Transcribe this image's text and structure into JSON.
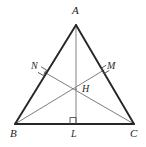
{
  "figure": {
    "kind": "geometry-diagram",
    "background_color": "#ffffff",
    "width": 146,
    "height": 147
  },
  "style": {
    "triangle_stroke_color": "#262626",
    "triangle_stroke_width": 1.9,
    "cevian_stroke_color": "#6e6e6e",
    "cevian_stroke_width": 0.9,
    "altitude_stroke_color": "#8c8c8c",
    "altitude_stroke_width": 1.1,
    "right_angle_stroke_color": "#4a4a4a",
    "right_angle_stroke_width": 0.9,
    "label_color": "#1a1a1a"
  },
  "points": {
    "A": {
      "label": "A",
      "x": 76,
      "y": 25,
      "label_x": 72,
      "label_y": 6
    },
    "B": {
      "label": "B",
      "x": 15,
      "y": 124,
      "label_x": 10,
      "label_y": 128
    },
    "C": {
      "label": "C",
      "x": 134,
      "y": 124,
      "label_x": 131,
      "label_y": 128
    },
    "L": {
      "label": "L",
      "x": 76,
      "y": 124,
      "label_x": 71,
      "label_y": 128
    },
    "M": {
      "label": "M",
      "x": 104,
      "y": 70,
      "label_x": 108,
      "label_y": 62
    },
    "N": {
      "label": "N",
      "x": 44,
      "y": 72,
      "label_x": 31,
      "label_y": 62
    },
    "H": {
      "label": "H",
      "x": 76,
      "y": 89,
      "label_x": 82,
      "label_y": 84
    }
  },
  "segments": [
    {
      "name": "side-AB",
      "from": "A",
      "to": "B",
      "role": "triangle-side"
    },
    {
      "name": "side-AC",
      "from": "A",
      "to": "C",
      "role": "triangle-side"
    },
    {
      "name": "side-BC",
      "from": "B",
      "to": "C",
      "role": "triangle-side"
    },
    {
      "name": "altitude-AL",
      "from": "A",
      "to": "L",
      "role": "altitude"
    },
    {
      "name": "cevian-BM",
      "from": "B",
      "to": "M",
      "role": "altitude"
    },
    {
      "name": "cevian-CN",
      "from": "C",
      "to": "N",
      "role": "altitude"
    }
  ],
  "right_angle_marks": [
    {
      "name": "right-angle-at-L",
      "at": "L"
    },
    {
      "name": "right-angle-at-M",
      "at": "M"
    },
    {
      "name": "right-angle-at-N",
      "at": "N"
    }
  ],
  "labels": {
    "apex": "A",
    "bottom_left": "B",
    "bottom_right": "C",
    "foot_on_BC": "L",
    "foot_on_AC": "M",
    "foot_on_AB": "N",
    "orthocenter": "H"
  }
}
